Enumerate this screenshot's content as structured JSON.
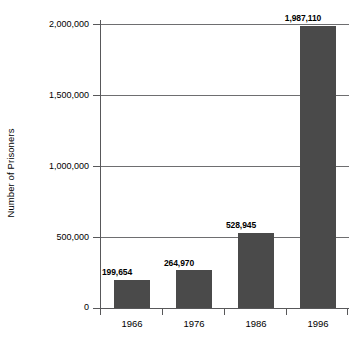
{
  "chart_data": {
    "type": "bar",
    "title": "",
    "xlabel": "",
    "ylabel": "Number of Prisoners",
    "categories": [
      "1966",
      "1976",
      "1986",
      "1996"
    ],
    "values": [
      199654,
      264970,
      528945,
      1987110
    ],
    "value_labels": [
      "199,654",
      "264,970",
      "528,945",
      "1,987,110"
    ],
    "ylim": [
      0,
      2000000
    ],
    "ytick_values": [
      0,
      500000,
      1000000,
      1500000,
      2000000
    ],
    "ytick_labels": [
      "0",
      "500,000",
      "1,000,000",
      "1,500,000",
      "2,000,000"
    ],
    "grid": true,
    "grid_axis": "y",
    "legend": false,
    "bar_color": "#4a4a4a",
    "axis_color": "#58585a",
    "grid_color": "#6e6e70",
    "background_color": "#ffffff",
    "text_color": "#000000"
  }
}
